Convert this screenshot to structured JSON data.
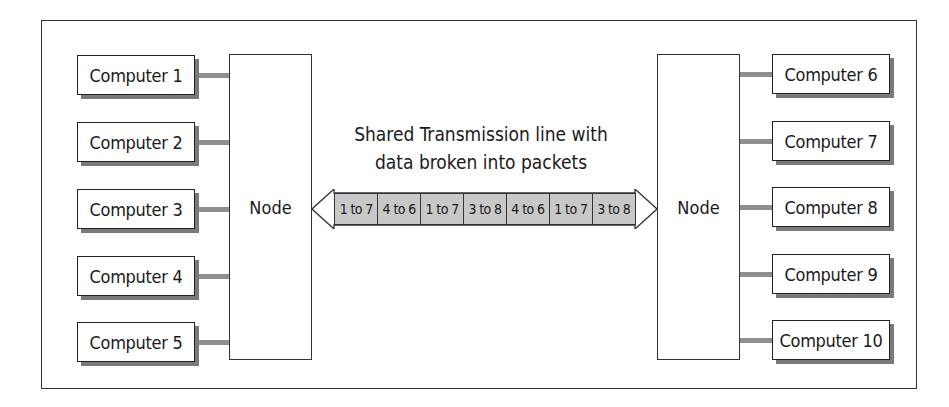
{
  "diagram": {
    "caption_line1": "Shared Transmission line with",
    "caption_line2": "data broken into packets",
    "left_node": {
      "label": "Node"
    },
    "right_node": {
      "label": "Node"
    },
    "left_computers": [
      {
        "label": "Computer 1"
      },
      {
        "label": "Computer 2"
      },
      {
        "label": "Computer 3"
      },
      {
        "label": "Computer 4"
      },
      {
        "label": "Computer 5"
      }
    ],
    "right_computers": [
      {
        "label": "Computer 6"
      },
      {
        "label": "Computer 7"
      },
      {
        "label": "Computer 8"
      },
      {
        "label": "Computer 9"
      },
      {
        "label": "Computer 10"
      }
    ],
    "packets": [
      {
        "label": "1 to 7"
      },
      {
        "label": "4 to 6"
      },
      {
        "label": "1 to 7"
      },
      {
        "label": "3 to 8"
      },
      {
        "label": "4 to 6"
      },
      {
        "label": "1 to 7"
      },
      {
        "label": "3 to 8"
      }
    ],
    "colors": {
      "packet_fill": "#c8c8c8",
      "link": "#8f8f8f",
      "shadow": "#7a7a7a",
      "stroke": "#333333"
    }
  }
}
